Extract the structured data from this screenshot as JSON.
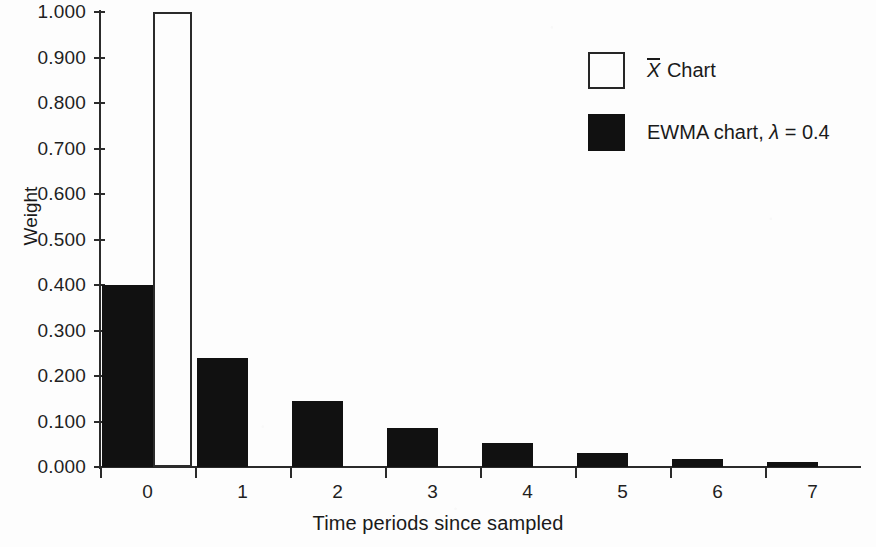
{
  "chart_data": {
    "type": "bar",
    "title": "",
    "xlabel": "Time periods since sampled",
    "ylabel": "Weight",
    "categories": [
      "0",
      "1",
      "2",
      "3",
      "4",
      "5",
      "6",
      "7"
    ],
    "ylim": [
      0.0,
      1.0
    ],
    "xlim": [
      0,
      8
    ],
    "grid": false,
    "legend_position": "top-right",
    "ytick_labels": [
      "1.000",
      "0.900",
      "0.800",
      "0.700",
      "0.600",
      "0.500",
      "0.400",
      "0.300",
      "0.200",
      "0.100",
      "0.000"
    ],
    "ytick_values": [
      1.0,
      0.9,
      0.8,
      0.7,
      0.6,
      0.5,
      0.4,
      0.3,
      0.2,
      0.1,
      0.0
    ],
    "xtick_labels": [
      "0",
      "1",
      "2",
      "3",
      "4",
      "5",
      "6",
      "7"
    ],
    "series": [
      {
        "name": "X-bar Chart",
        "legend_label_prefix": "",
        "legend_label_math": "X",
        "legend_label_suffix": " Chart",
        "style": "hollow",
        "color": "#ffffff",
        "edge_color": "#2b2b2b",
        "values": [
          1.0,
          null,
          null,
          null,
          null,
          null,
          null,
          null
        ]
      },
      {
        "name": "EWMA chart, lambda = 0.4",
        "legend_label_prefix": "EWMA chart, ",
        "legend_label_math": "λ",
        "legend_label_suffix": " = 0.4",
        "style": "filled",
        "color": "#111111",
        "edge_color": "#111111",
        "values": [
          0.4,
          0.24,
          0.144,
          0.0864,
          0.0518,
          0.0311,
          0.0187,
          0.0112
        ]
      }
    ]
  },
  "legend": {
    "items": [
      {
        "swatch": "hollow",
        "math": "X",
        "overbar": true,
        "before": "",
        "after": " Chart"
      },
      {
        "swatch": "filled",
        "math": "λ",
        "overbar": false,
        "before": "EWMA chart, ",
        "after": " = 0.4"
      }
    ]
  },
  "axes": {
    "y_title": "Weight",
    "x_title": "Time periods since sampled"
  }
}
